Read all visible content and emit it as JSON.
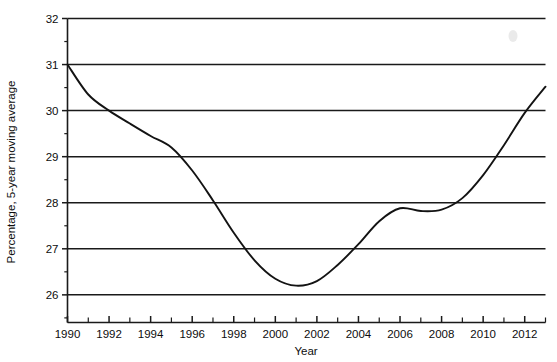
{
  "chart_data": {
    "type": "line",
    "title": "",
    "xlabel": "Year",
    "ylabel": "Percentage, 5-year moving average",
    "xlim": [
      1990,
      2013
    ],
    "ylim": [
      25.4,
      32
    ],
    "grid": true,
    "grid_axis": "y",
    "legend": false,
    "legend_position": "none",
    "y_ticks": [
      26,
      27,
      28,
      29,
      30,
      31,
      32
    ],
    "y_tick_labels": [
      "26",
      "27",
      "28",
      "29",
      "30",
      "31",
      "32"
    ],
    "y_minor_ticks": [
      25.5,
      26.5,
      27.5,
      28.5,
      29.5,
      30.5,
      31.5
    ],
    "x_ticks": [
      1990,
      1991,
      1992,
      1993,
      1994,
      1995,
      1996,
      1997,
      1998,
      1999,
      2000,
      2001,
      2002,
      2003,
      2004,
      2005,
      2006,
      2007,
      2008,
      2009,
      2010,
      2011,
      2012,
      2013
    ],
    "x_tick_labels": [
      "1990",
      "",
      "1992",
      "",
      "1994",
      "",
      "1996",
      "",
      "1998",
      "",
      "2000",
      "",
      "2002",
      "",
      "2004",
      "",
      "2006",
      "",
      "2008",
      "",
      "2010",
      "",
      "2012",
      ""
    ],
    "x_labeled_ticks": [
      1990,
      1992,
      1994,
      1996,
      1998,
      2000,
      2002,
      2004,
      2006,
      2008,
      2010,
      2012
    ],
    "series": [
      {
        "name": "Percentage, 5-year moving average",
        "color": "#131313",
        "x": [
          1990,
          1991,
          1992,
          1993,
          1994,
          1995,
          1996,
          1997,
          1998,
          1999,
          2000,
          2001,
          2002,
          2003,
          2004,
          2005,
          2006,
          2007,
          2008,
          2009,
          2010,
          2011,
          2012,
          2013
        ],
        "values": [
          31.0,
          30.35,
          30.0,
          29.72,
          29.45,
          29.2,
          28.7,
          28.05,
          27.35,
          26.75,
          26.35,
          26.2,
          26.3,
          26.65,
          27.1,
          27.6,
          27.88,
          27.82,
          27.85,
          28.1,
          28.6,
          29.25,
          29.95,
          30.52
        ]
      }
    ],
    "annotations": [
      {
        "kind": "start-point",
        "x": 1990,
        "y": 31.0
      },
      {
        "kind": "minimum",
        "x": 2001,
        "y": 26.2
      },
      {
        "kind": "local-maximum",
        "x": 2006,
        "y": 27.88
      },
      {
        "kind": "local-minimum",
        "x": 2007.6,
        "y": 27.82
      },
      {
        "kind": "end-point",
        "x": 2013,
        "y": 30.52
      }
    ]
  }
}
